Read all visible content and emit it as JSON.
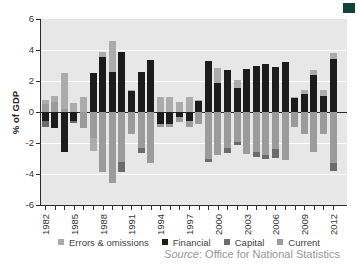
{
  "y_axis": {
    "title": "% of GDP",
    "ticks": [
      6,
      4,
      2,
      0,
      -2,
      -4,
      -6
    ],
    "min": -6,
    "max": 6
  },
  "x_axis": {
    "labeled_years": [
      "1982",
      "1985",
      "1988",
      "1991",
      "1994",
      "1997",
      "2000",
      "2003",
      "2006",
      "2009",
      "2012"
    ],
    "label_step": 3
  },
  "legend": {
    "items": [
      {
        "label": "Errors & omissions",
        "color": "#ababab"
      },
      {
        "label": "Financial",
        "color": "#1c1c1c"
      },
      {
        "label": "Capital",
        "color": "#6b6b6b"
      },
      {
        "label": "Current",
        "color": "#9b9b9b"
      }
    ]
  },
  "source": {
    "prefix": "Source",
    "text": ": Office for National Statistics"
  },
  "colors": {
    "plot_background": "#e7e7e7",
    "gridline": "#ffffff",
    "axis": "#2b2b2b",
    "corner_accent": "#16423c"
  },
  "chart_data": {
    "type": "bar",
    "stacked": true,
    "title": "",
    "xlabel": "",
    "ylabel": "% of GDP",
    "ylim": [
      -6,
      6
    ],
    "gridlines_at": [
      -4,
      -2,
      2,
      4
    ],
    "legend_position": "bottom",
    "source": "Office for National Statistics",
    "categories": [
      1982,
      1983,
      1984,
      1985,
      1986,
      1987,
      1988,
      1989,
      1990,
      1991,
      1992,
      1993,
      1994,
      1995,
      1996,
      1997,
      1998,
      1999,
      2000,
      2001,
      2002,
      2003,
      2004,
      2005,
      2006,
      2007,
      2008,
      2009,
      2010,
      2011,
      2012
    ],
    "series": [
      {
        "name": "Financial",
        "color": "#1c1c1c",
        "values": [
          -0.6,
          -1.05,
          -2.55,
          -0.55,
          0,
          2.5,
          3.55,
          2.6,
          3.9,
          1.35,
          2.6,
          3.35,
          -0.75,
          -0.8,
          -0.35,
          -0.6,
          0.7,
          3.3,
          1.9,
          2.7,
          1.55,
          2.8,
          3.0,
          3.1,
          2.9,
          3.25,
          0.95,
          1.15,
          2.4,
          1.05,
          3.4
        ]
      },
      {
        "name": "Current",
        "color": "#9b9b9b",
        "values": [
          0.5,
          0.65,
          0.2,
          0,
          -1.0,
          -1.7,
          -3.85,
          -4.55,
          -3.25,
          -1.4,
          -2.3,
          -3.3,
          -0.2,
          -0.2,
          -0.3,
          -0.35,
          -0.8,
          -3.0,
          -2.75,
          -2.3,
          -1.95,
          -2.7,
          -2.6,
          -2.75,
          -2.4,
          -3.1,
          -0.95,
          -1.4,
          -2.55,
          -1.4,
          -3.3
        ]
      },
      {
        "name": "Capital",
        "color": "#6b6b6b",
        "values": [
          -0.35,
          0,
          0,
          -0.15,
          0,
          0,
          0,
          0,
          -0.6,
          0,
          -0.35,
          0,
          0,
          0,
          0,
          0,
          0,
          -0.2,
          0,
          -0.35,
          -0.15,
          0,
          -0.3,
          -0.3,
          -0.6,
          0,
          0,
          0,
          0,
          0,
          -0.5
        ]
      },
      {
        "name": "Errors & omissions",
        "color": "#ababab",
        "values": [
          0.3,
          0.4,
          2.3,
          0.6,
          0.95,
          -0.8,
          0.35,
          1.95,
          0,
          0.05,
          0,
          0,
          0.95,
          1.0,
          0.65,
          0.95,
          0.1,
          0,
          0.95,
          0,
          0.5,
          0,
          0,
          0,
          0,
          0,
          0.05,
          0.3,
          0.3,
          0.4,
          0.4
        ]
      }
    ]
  }
}
